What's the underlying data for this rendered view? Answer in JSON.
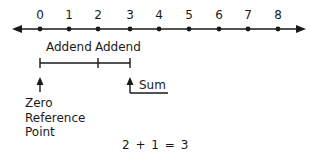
{
  "number_line": {
    "ticks": [
      {
        "value": "0",
        "x": 40
      },
      {
        "value": "1",
        "x": 69
      },
      {
        "value": "2",
        "x": 98
      },
      {
        "value": "3",
        "x": 130
      },
      {
        "value": "4",
        "x": 159
      },
      {
        "value": "5",
        "x": 189
      },
      {
        "value": "6",
        "x": 219
      },
      {
        "value": "7",
        "x": 248
      },
      {
        "value": "8",
        "x": 278
      }
    ]
  },
  "addend_labels": {
    "first": "Addend",
    "second": "Addend"
  },
  "zero_reference": {
    "line1": "Zero",
    "line2": "Reference",
    "line3": "Point"
  },
  "sum_label": "Sum",
  "equation": "2 + 1 = 3",
  "colors": {
    "ink": "#1a1a1a",
    "background": "#ffffff"
  }
}
